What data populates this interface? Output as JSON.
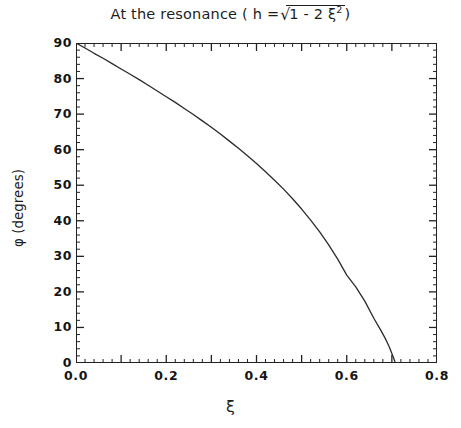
{
  "chart_data": {
    "type": "line",
    "title_parts": {
      "lead": "At the resonance ( h =",
      "sqrt_glyph": "√",
      "radicand": "1 - 2 ξ",
      "radicand_exp": "2",
      "trail": " )"
    },
    "xlabel": "ξ",
    "ylabel": "φ (degrees)",
    "xlim": [
      0.0,
      0.8
    ],
    "ylim": [
      0,
      90
    ],
    "grid": false,
    "legend": null,
    "x_major_ticks": [
      0.0,
      0.1,
      0.2,
      0.3,
      0.4,
      0.5,
      0.6,
      0.7,
      0.8
    ],
    "x_tick_labels": [
      "0.0",
      "0.2",
      "0.4",
      "0.6",
      "0.8"
    ],
    "x_tick_label_values": [
      0.0,
      0.2,
      0.4,
      0.6,
      0.8
    ],
    "x_minor_per_major": 5,
    "y_major_ticks": [
      0,
      10,
      20,
      30,
      40,
      50,
      60,
      70,
      80,
      90
    ],
    "y_tick_labels": [
      "90",
      "80",
      "70",
      "60",
      "50",
      "40",
      "30",
      "20",
      "10",
      "0"
    ],
    "y_tick_label_values": [
      90,
      80,
      70,
      60,
      50,
      40,
      30,
      20,
      10,
      0
    ],
    "y_minor_per_major": 5,
    "series": [
      {
        "name": "phase angle at resonance",
        "color": "#2a2a2a",
        "x": [
          0.0,
          0.02,
          0.04,
          0.06,
          0.08,
          0.1,
          0.12,
          0.14,
          0.16,
          0.18,
          0.2,
          0.22,
          0.24,
          0.26,
          0.28,
          0.3,
          0.32,
          0.34,
          0.36,
          0.38,
          0.4,
          0.42,
          0.44,
          0.46,
          0.48,
          0.5,
          0.52,
          0.54,
          0.56,
          0.58,
          0.6,
          0.62,
          0.64,
          0.66,
          0.675,
          0.685,
          0.69,
          0.695,
          0.7,
          0.703,
          0.705,
          0.7065,
          0.7071
        ],
        "y": [
          90.0,
          88.6,
          87.1,
          85.7,
          84.2,
          82.7,
          81.2,
          79.7,
          78.1,
          76.5,
          74.9,
          73.3,
          71.6,
          69.9,
          68.1,
          66.3,
          64.4,
          62.4,
          60.4,
          58.3,
          56.1,
          53.8,
          51.4,
          48.9,
          46.2,
          43.3,
          40.2,
          36.9,
          33.2,
          29.2,
          24.7,
          21.4,
          17.4,
          12.6,
          9.3,
          7.0,
          5.7,
          4.3,
          2.7,
          1.7,
          1.0,
          0.5,
          0.0
        ]
      }
    ]
  },
  "axes": {
    "title": "At the resonance ( h =√1 - 2 ξ² )",
    "xlabel": "ξ",
    "ylabel": "φ (degrees)"
  }
}
